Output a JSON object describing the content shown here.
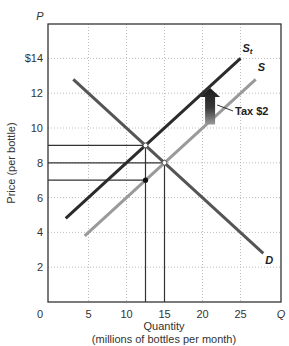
{
  "chart_data": {
    "type": "line",
    "title": "",
    "xlabel": "Quantity",
    "xlabel_sub": "(millions of bottles per month)",
    "ylabel": "Price (per bottle)",
    "x_axis_symbol": "Q",
    "y_axis_symbol": "P",
    "xlim": [
      0,
      30
    ],
    "ylim": [
      0,
      16
    ],
    "x_ticks": [
      0,
      5,
      10,
      15,
      20,
      25
    ],
    "x_tick_labels": [
      "0",
      "5",
      "10",
      "15",
      "20",
      "25"
    ],
    "y_ticks": [
      2,
      4,
      6,
      8,
      10,
      12,
      14
    ],
    "y_tick_labels": [
      "2",
      "4",
      "6",
      "8",
      "10",
      "12",
      "$14"
    ],
    "grid": true,
    "series": [
      {
        "name": "St",
        "label_main": "S",
        "label_sub": "t",
        "color": "#2b2b2b",
        "x": [
          2,
          25
        ],
        "y": [
          4.8,
          14
        ]
      },
      {
        "name": "S",
        "label_main": "S",
        "label_sub": "",
        "color": "#9a9a9a",
        "x": [
          4.5,
          27
        ],
        "y": [
          3.8,
          12.8
        ]
      },
      {
        "name": "D",
        "label_main": "D",
        "label_sub": "",
        "color": "#555555",
        "x": [
          3,
          28
        ],
        "y": [
          12.8,
          2.8
        ]
      }
    ],
    "equilibria": [
      {
        "name": "with tax",
        "q": 12.5,
        "p": 9,
        "marker": "open"
      },
      {
        "name": "without tax",
        "q": 15,
        "p": 8,
        "marker": "open"
      },
      {
        "name": "seller net price",
        "q": 12.5,
        "p": 7,
        "marker": "filled"
      }
    ],
    "reference_lines": {
      "horizontal_p": [
        9,
        8,
        7
      ],
      "vertical_q": [
        12.5,
        15
      ]
    },
    "annotations": [
      {
        "text": "Tax $2",
        "type": "arrow-up",
        "arrow_q": 21,
        "arrow_p_from": 10.2,
        "arrow_p_to": 12.3
      }
    ]
  },
  "labels": {
    "tax": "Tax $2"
  }
}
